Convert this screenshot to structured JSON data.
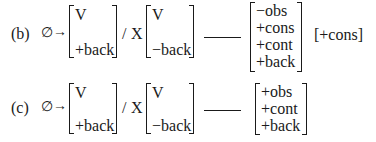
{
  "rules": [
    {
      "label": "(b)",
      "empty_set": "∅",
      "arrow": "→",
      "target_matrix": [
        "V",
        "+back"
      ],
      "slash": "/",
      "context_symbol": "X",
      "context_matrix": [
        "V",
        "−back"
      ],
      "right_matrix": [
        "−obs",
        "+cons",
        "+cont",
        "+back"
      ],
      "extra_feature": "[+cons]"
    },
    {
      "label": "(c)",
      "empty_set": "∅",
      "arrow": "→",
      "target_matrix": [
        "V",
        "+back"
      ],
      "slash": "/",
      "context_symbol": "X",
      "context_matrix": [
        "V",
        "−back"
      ],
      "right_matrix": [
        "+obs",
        "+cont",
        "+back"
      ]
    }
  ]
}
